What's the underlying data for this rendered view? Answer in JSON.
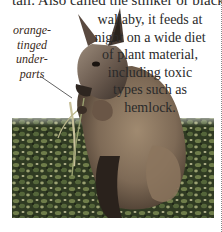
{
  "page": {
    "top_text": "tail. Also called the stinker or black",
    "body_lines": [
      "wallaby, it feeds at",
      "night on a wide diet",
      "of plant material,",
      "including toxic",
      "types such as",
      "hemlock."
    ],
    "annotation": {
      "lines": [
        "orange-",
        "tinged",
        "under-",
        "parts"
      ],
      "color": "#3a2a20"
    },
    "photo": {
      "subject": "wallaby-holding-plant-stem",
      "background": "leafy-ground-cover"
    }
  }
}
